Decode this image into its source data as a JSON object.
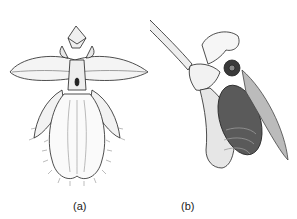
{
  "figure": {
    "panels": [
      {
        "id": "a",
        "label": "(a)",
        "subject": "orchid flower, front view"
      },
      {
        "id": "b",
        "label": "(b)",
        "subject": "orchid flower with bee pollinator, side view"
      }
    ],
    "colors": {
      "ink": "#222222",
      "background": "#ffffff",
      "shade": "#555555"
    }
  }
}
